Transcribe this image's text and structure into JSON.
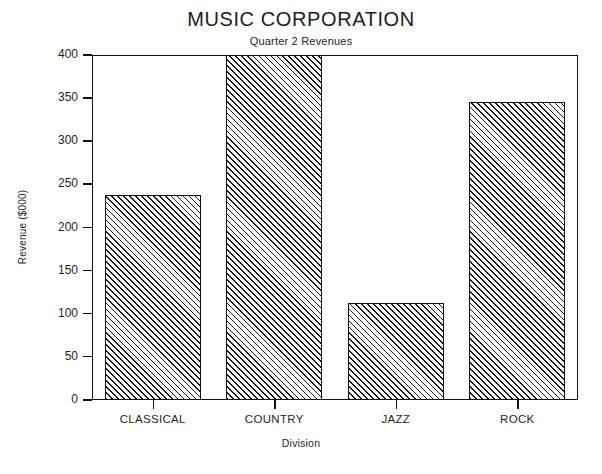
{
  "chart_data": {
    "type": "bar",
    "title": "MUSIC CORPORATION",
    "subtitle": "Quarter 2 Revenues",
    "xlabel": "Division",
    "ylabel": "Revenue ($000)",
    "categories": [
      "CLASSICAL",
      "COUNTRY",
      "JAZZ",
      "ROCK"
    ],
    "values": [
      238,
      400,
      112,
      345
    ],
    "ylim": [
      0,
      400
    ],
    "yticks": [
      0,
      50,
      100,
      150,
      200,
      250,
      300,
      350,
      400
    ],
    "ytick_labels": [
      "0",
      "50",
      "100",
      "150",
      "200",
      "250",
      "300",
      "350",
      "400"
    ],
    "grid": false,
    "legend": "none",
    "bar_fill": "diagonal-hatch",
    "bar_edge_color": "#111111",
    "plot_background": "#ffffff"
  }
}
